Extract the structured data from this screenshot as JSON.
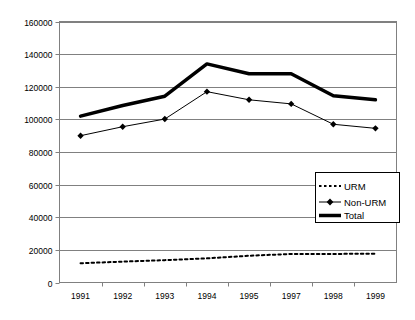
{
  "chart_data": {
    "type": "line",
    "title": "",
    "xlabel": "",
    "ylabel": "",
    "categories": [
      "1991",
      "1992",
      "1993",
      "1994",
      "1995",
      "1997",
      "1998",
      "1999"
    ],
    "ylim": [
      0,
      160000
    ],
    "ytick_labels": [
      "160000",
      "140000",
      "120000",
      "100000",
      "80000",
      "60000",
      "40000",
      "20000",
      "0"
    ],
    "ytick_values": [
      160000,
      140000,
      120000,
      100000,
      80000,
      60000,
      40000,
      20000,
      0
    ],
    "grid": true,
    "grid_axis": "y",
    "legend_position": "center-right",
    "series": [
      {
        "name": "URM",
        "values": [
          11800,
          12800,
          13700,
          14800,
          16400,
          17500,
          17500,
          17700
        ],
        "style": "dashed",
        "color": "#000000",
        "marker": "none",
        "line_width": 2
      },
      {
        "name": "Non-URM",
        "values": [
          90000,
          95500,
          100200,
          117000,
          112000,
          109500,
          97000,
          94500
        ],
        "style": "solid",
        "color": "#000000",
        "marker": "diamond",
        "line_width": 1
      },
      {
        "name": "Total",
        "values": [
          102000,
          108500,
          114200,
          134000,
          128000,
          128000,
          114500,
          112000
        ],
        "style": "solid",
        "color": "#000000",
        "marker": "none",
        "line_width": 3.5
      }
    ]
  },
  "legend": {
    "entries": [
      {
        "label": "URM"
      },
      {
        "label": "Non-URM"
      },
      {
        "label": "Total"
      }
    ]
  },
  "axes": {
    "frame_color": "#808080",
    "grid_color": "#808080"
  }
}
